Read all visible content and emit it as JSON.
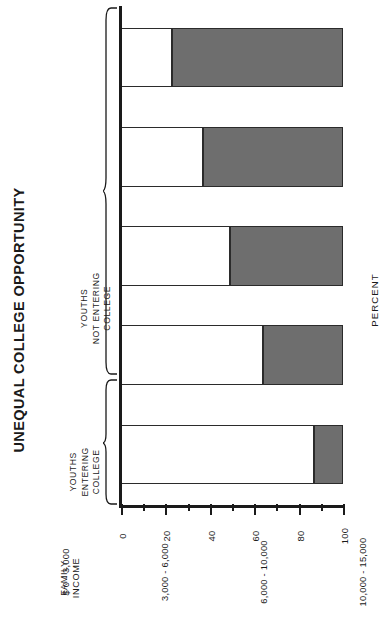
{
  "title": "UNEQUAL COLLEGE OPPORTUNITY",
  "legend": {
    "entering": {
      "line1": "YOUTHS",
      "line2": "ENTERING",
      "line3": "COLLEGE"
    },
    "not_entering": {
      "line1": "YOUTHS",
      "line2": "NOT ENTERING",
      "line3": "COLLEGE"
    }
  },
  "axes": {
    "percent_title": "PERCENT",
    "category_title": {
      "line1": "FAMILY",
      "line2": "INCOME"
    },
    "percent_ticks": [
      "0",
      "20",
      "40",
      "60",
      "80",
      "100"
    ]
  },
  "colors": {
    "entering": "#ffffff",
    "not_entering": "#6e6e6e",
    "ink": "#1a1a1a"
  },
  "chart_data": {
    "type": "bar",
    "orientation": "horizontal",
    "stacked": true,
    "stack_total": 100,
    "title": "UNEQUAL COLLEGE OPPORTUNITY",
    "xlabel": "PERCENT",
    "ylabel": "FAMILY INCOME",
    "xlim": [
      0,
      100
    ],
    "xticks": [
      0,
      10,
      20,
      30,
      40,
      50,
      60,
      70,
      80,
      90,
      100
    ],
    "xticklabels": [
      "0",
      "",
      "20",
      "",
      "40",
      "",
      "60",
      "",
      "80",
      "",
      "100"
    ],
    "grid": false,
    "legend_position": "top-left",
    "categories": [
      "$  0 - 3,000",
      "3,000 - 6,000",
      "6,000 - 10,000",
      "10,000 - 15,000",
      "15,000 AND OVER"
    ],
    "series": [
      {
        "name": "YOUTHS ENTERING COLLEGE",
        "color": "#ffffff",
        "values": [
          23,
          37,
          49,
          64,
          87
        ]
      },
      {
        "name": "YOUTHS NOT ENTERING COLLEGE",
        "color": "#6e6e6e",
        "values": [
          77,
          63,
          51,
          36,
          13
        ]
      }
    ]
  }
}
